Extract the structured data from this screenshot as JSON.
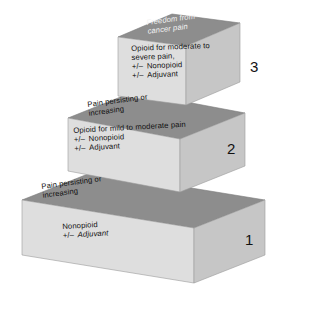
{
  "figure": {
    "type": "stepped-3d-pyramid",
    "background_color": "#ffffff",
    "colors": {
      "top_face": "#8d8d8d",
      "front_face": "#dedede",
      "side_face": "#c6c6c6",
      "dark_text": "#111111",
      "light_text": "#f2f2f2"
    }
  },
  "steps": [
    {
      "number": "1",
      "level": 1,
      "top_face_text": {
        "line1": "Pain persisting or",
        "line2": "increasing",
        "color": "#111111"
      },
      "front_face_text": {
        "line1": "Nonopioid",
        "line2_symbol": "+/–",
        "line2": "Adjuvant"
      }
    },
    {
      "number": "2",
      "level": 2,
      "top_face_text": {
        "line1": "Pain persisting or",
        "line2": "increasing",
        "color": "#111111"
      },
      "front_face_text": {
        "line1": "Opioid for mild to moderate pain",
        "line2_symbol": "+/–",
        "line2": "Nonopioid",
        "line3_symbol": "+/–",
        "line3": "Adjuvant"
      }
    },
    {
      "number": "3",
      "level": 3,
      "top_face_text": {
        "line1": "Freedom from",
        "line2": "cancer pain",
        "color": "#f2f2f2"
      },
      "front_face_text": {
        "line1": "Opioid for moderate to",
        "line2": "severe pain,",
        "line3_symbol": "+/–",
        "line3": "Nonopioid",
        "line4_symbol": "+/–",
        "line4": "Adjuvant"
      }
    }
  ]
}
